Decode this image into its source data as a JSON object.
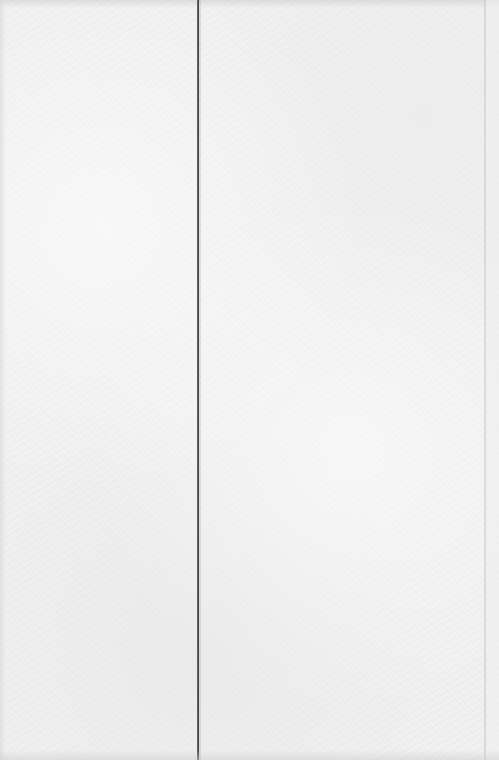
{
  "page": {
    "background_color": "#f2f2f2",
    "rule_color": "#3c3c3c",
    "columns": [
      {
        "id": "left",
        "text": ""
      },
      {
        "id": "right",
        "text": ""
      }
    ]
  }
}
